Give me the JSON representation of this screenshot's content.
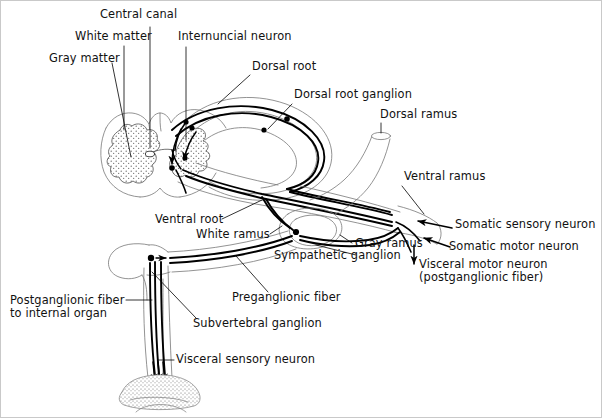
{
  "figure": {
    "canvas": {
      "width": 601,
      "height": 417
    },
    "background_color": "#ffffff",
    "ink_color": "#000000",
    "frame_color": "#c9c9c9"
  },
  "labels": {
    "central_canal": "Central canal",
    "white_matter": "White matter",
    "gray_matter": "Gray matter",
    "internuncial_neuron": "Internuncial neuron",
    "dorsal_root": "Dorsal root",
    "dorsal_root_ganglion": "Dorsal root ganglion",
    "dorsal_ramus": "Dorsal ramus",
    "ventral_ramus": "Ventral ramus",
    "ventral_root": "Ventral root",
    "white_ramus": "White ramus",
    "gray_ramus": "Gray ramus",
    "somatic_sensory_neuron": "Somatic sensory neuron",
    "somatic_motor_neuron": "Somatic motor neuron",
    "visceral_motor_neuron": "Visceral motor neuron",
    "visceral_motor_neuron_sub": "(postganglionic fiber)",
    "sympathetic_ganglion": "Sympathetic ganglion",
    "preganglionic_fiber": "Preganglionic fiber",
    "subvertebral_ganglion": "Subvertebral ganglion",
    "postganglionic_fiber_1": "Postganglionic fiber",
    "postganglionic_fiber_2": "to internal organ",
    "visceral_sensory_neuron": "Visceral sensory neuron"
  },
  "structures": {
    "spinal_cord": "spinal-cord-cross-section",
    "gray_matter_shape": "butterfly-stippled",
    "dorsal_root_loop": "teardrop-loop",
    "ganglion_bodies": [
      "dorsal-root-ganglion",
      "sympathetic-ganglion",
      "subvertebral-ganglion"
    ],
    "target_organ": "internal-organ-stippled-dome"
  }
}
